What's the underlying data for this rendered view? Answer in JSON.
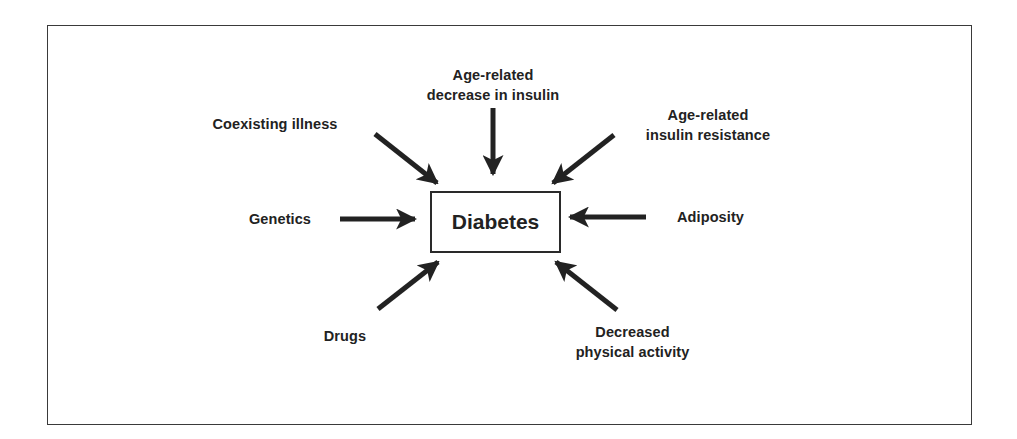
{
  "diagram": {
    "center": {
      "label": "Diabetes"
    },
    "factors": [
      {
        "id": "age-decrease-insulin",
        "lines": [
          "Age-related",
          "decrease in insulin"
        ],
        "position": "top"
      },
      {
        "id": "coexisting-illness",
        "lines": [
          "Coexisting illness"
        ],
        "position": "top-left"
      },
      {
        "id": "age-insulin-resistance",
        "lines": [
          "Age-related",
          "insulin resistance"
        ],
        "position": "top-right"
      },
      {
        "id": "genetics",
        "lines": [
          "Genetics"
        ],
        "position": "left"
      },
      {
        "id": "adiposity",
        "lines": [
          "Adiposity"
        ],
        "position": "right"
      },
      {
        "id": "drugs",
        "lines": [
          "Drugs"
        ],
        "position": "bottom-left"
      },
      {
        "id": "decreased-physical-activity",
        "lines": [
          "Decreased",
          "physical activity"
        ],
        "position": "bottom-right"
      }
    ],
    "arrow_direction": "inward-to-center",
    "colors": {
      "ink": "#222222",
      "background": "#ffffff"
    }
  }
}
